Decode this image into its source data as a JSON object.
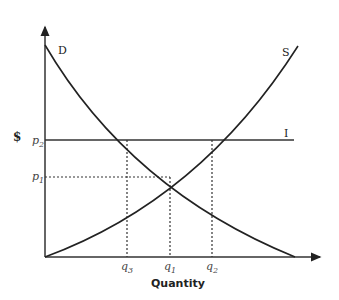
{
  "diagram": {
    "y_axis_label": "$",
    "x_axis_label": "Quantity",
    "curves": {
      "demand": {
        "label": "D"
      },
      "supply": {
        "label": "S"
      },
      "price_line": {
        "label": "I"
      }
    },
    "price_levels": [
      {
        "name": "p",
        "sub": "2"
      },
      {
        "name": "p",
        "sub": "1"
      }
    ],
    "quantities": [
      {
        "name": "q",
        "sub": "3"
      },
      {
        "name": "q",
        "sub": "1"
      },
      {
        "name": "q",
        "sub": "2"
      }
    ],
    "colors": {
      "line": "#222222",
      "text": "#222222"
    }
  }
}
